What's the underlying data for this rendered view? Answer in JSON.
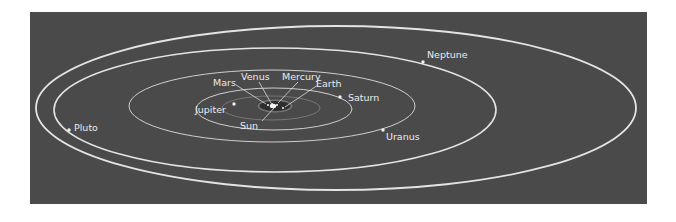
{
  "diagram": {
    "colors": {
      "page_background": "#ffffff",
      "panel_background": "#4a4a4a",
      "orbit_outer": "#e4e4e4",
      "orbit_inner": "#cfcfcf",
      "orbit_faint": "#8a8a8a",
      "label": "#ececec",
      "leader_line": "#dcdcdc",
      "planet_dot": "#f0f0f0",
      "sun": "#f5f5f5"
    },
    "panel": {
      "x": 30,
      "y": 12,
      "width": 617,
      "height": 192
    },
    "sun": {
      "label": "Sun",
      "cx": 273,
      "cy": 106
    },
    "orbits": [
      {
        "name": "Pluto",
        "cx": 336,
        "cy": 108,
        "rx": 300,
        "ry": 82,
        "stroke_width": 1.8
      },
      {
        "name": "Neptune",
        "cx": 275,
        "cy": 110,
        "rx": 221,
        "ry": 62,
        "stroke_width": 1.6
      },
      {
        "name": "Uranus",
        "cx": 272,
        "cy": 106,
        "rx": 143,
        "ry": 36,
        "stroke_width": 1.0
      },
      {
        "name": "Saturn",
        "cx": 274,
        "cy": 109,
        "rx": 78,
        "ry": 21,
        "stroke_width": 1.0
      },
      {
        "name": "Jupiter",
        "cx": 271,
        "cy": 108,
        "rx": 49,
        "ry": 12,
        "stroke_width": 0.7
      },
      {
        "name": "Mars",
        "cx": 275,
        "cy": 106,
        "rx": 17,
        "ry": 6,
        "stroke_width": 0.8
      },
      {
        "name": "Earth",
        "cx": 275,
        "cy": 106,
        "rx": 12,
        "ry": 4,
        "stroke_width": 0.6
      },
      {
        "name": "Venus",
        "cx": 275,
        "cy": 106,
        "rx": 8,
        "ry": 3,
        "stroke_width": 0.5
      },
      {
        "name": "Mercury",
        "cx": 275,
        "cy": 106,
        "rx": 5,
        "ry": 2,
        "stroke_width": 0.5
      }
    ],
    "planets": [
      {
        "name": "Pluto",
        "label": "Pluto",
        "dot": [
          69,
          130
        ],
        "text": [
          74,
          131
        ]
      },
      {
        "name": "Neptune",
        "label": "Neptune",
        "dot": [
          423,
          62
        ],
        "text": [
          427,
          58
        ]
      },
      {
        "name": "Uranus",
        "label": "Uranus",
        "dot": [
          383,
          130
        ],
        "text": [
          386,
          140
        ]
      },
      {
        "name": "Saturn",
        "label": "Saturn",
        "dot": [
          340,
          97
        ],
        "text": [
          348,
          101
        ]
      },
      {
        "name": "Jupiter",
        "label": "Jupiter",
        "dot": [
          234,
          104
        ],
        "text": [
          195,
          113
        ]
      },
      {
        "name": "Earth",
        "label": "Earth",
        "dot": [
          283,
          108
        ],
        "text": [
          316,
          87
        ]
      },
      {
        "name": "Mercury",
        "label": "Mercury",
        "dot": [
          277,
          105
        ],
        "text": [
          282,
          80
        ]
      },
      {
        "name": "Venus",
        "label": "Venus",
        "dot": [
          272,
          104
        ],
        "text": [
          241,
          80
        ]
      },
      {
        "name": "Mars",
        "label": "Mars",
        "dot": [
          268,
          105
        ],
        "text": [
          213,
          86
        ]
      }
    ],
    "leaders": [
      {
        "name": "Mars",
        "from": [
          236,
          85
        ],
        "to": [
          266,
          104
        ]
      },
      {
        "name": "Venus",
        "from": [
          259,
          82
        ],
        "to": [
          271,
          103
        ]
      },
      {
        "name": "Mercury",
        "from": [
          298,
          82
        ],
        "to": [
          278,
          103
        ]
      },
      {
        "name": "Earth",
        "from": [
          318,
          85
        ],
        "to": [
          285,
          107
        ]
      },
      {
        "name": "Sun",
        "from": [
          262,
          121
        ],
        "to": [
          275,
          107
        ]
      }
    ],
    "sun_label_pos": [
      240,
      129
    ]
  }
}
